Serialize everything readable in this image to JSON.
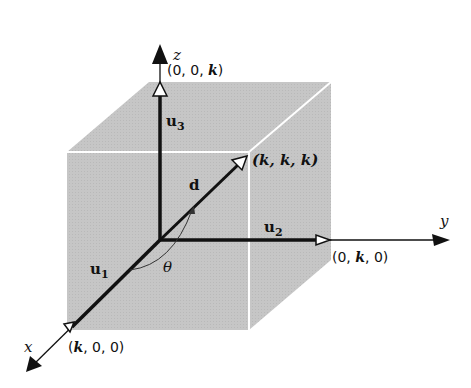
{
  "diagram": {
    "colors": {
      "cube_fill": "#c8c8c8",
      "cube_edge": "#ffffff",
      "axis": "#111111",
      "background": "#ffffff"
    },
    "axes": {
      "x": {
        "label": "x"
      },
      "y": {
        "label": "y"
      },
      "z": {
        "label": "z"
      }
    },
    "vectors": {
      "u1": {
        "label": "u",
        "subscript": "1"
      },
      "u2": {
        "label": "u",
        "subscript": "2"
      },
      "u3": {
        "label": "u",
        "subscript": "3"
      },
      "d": {
        "label": "d"
      }
    },
    "points": {
      "z_point": {
        "open": "(0, 0, ",
        "var": "k",
        "close": ")"
      },
      "y_point": {
        "open": "(0, ",
        "var": "k",
        "close": ", 0)"
      },
      "x_point": {
        "open": "(",
        "var": "k",
        "close": ", 0, 0)"
      },
      "diag_point": {
        "text": "(k, k, k)"
      }
    },
    "angle": {
      "label": "θ"
    }
  }
}
